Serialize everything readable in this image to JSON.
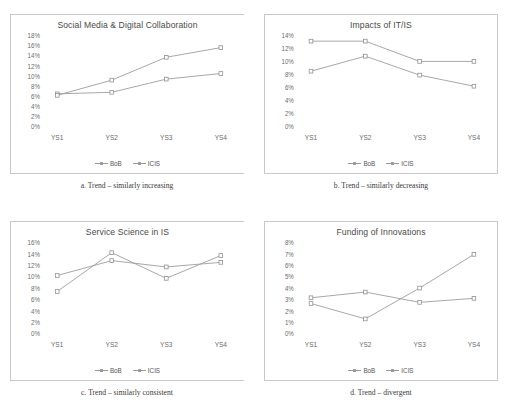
{
  "figure": {
    "series_names": [
      "BoB",
      "ICIS"
    ],
    "x_categories": [
      "YS1",
      "YS2",
      "YS3",
      "YS4"
    ],
    "line_color": "#9a9a9a",
    "panel_border_color": "#c9c9c9"
  },
  "panels": [
    {
      "key": "a",
      "caption_label": "a.",
      "caption_text": "Trend – similarly increasing",
      "caption": "a.  Trend – similarly increasing"
    },
    {
      "key": "b",
      "caption_label": "b.",
      "caption_text": "Trend – similarly decreasing",
      "caption": "b.  Trend – similarly decreasing"
    },
    {
      "key": "c",
      "caption_label": "c.",
      "caption_text": "Trend – similarly consistent",
      "caption": "c.  Trend – similarly consistent"
    },
    {
      "key": "d",
      "caption_label": "d.",
      "caption_text": "Trend – divergent",
      "caption": "d.  Trend – divergent"
    }
  ],
  "chart_data": [
    {
      "type": "line",
      "title": "Social Media & Digital Collaboration",
      "xlabel": "",
      "ylabel": "",
      "categories": [
        "YS1",
        "YS2",
        "YS3",
        "YS4"
      ],
      "ylim": [
        0,
        18
      ],
      "yticks": [
        18,
        16,
        14,
        12,
        10,
        8,
        6,
        4,
        2,
        0
      ],
      "ytick_labels": [
        "18%",
        "16%",
        "14%",
        "12%",
        "10%",
        "8%",
        "6%",
        "4%",
        "2%",
        "0%"
      ],
      "grid": false,
      "legend_position": "bottom",
      "series": [
        {
          "name": "BoB",
          "values": [
            6.6,
            6.9,
            9.5,
            10.6
          ]
        },
        {
          "name": "ICIS",
          "values": [
            6.3,
            9.3,
            13.8,
            15.7
          ]
        }
      ]
    },
    {
      "type": "line",
      "title": "Impacts of IT/IS",
      "xlabel": "",
      "ylabel": "",
      "categories": [
        "YS1",
        "YS2",
        "YS3",
        "YS4"
      ],
      "ylim": [
        0,
        14
      ],
      "yticks": [
        14,
        12,
        10,
        8,
        6,
        4,
        2,
        0
      ],
      "ytick_labels": [
        "14%",
        "12%",
        "10%",
        "8%",
        "6%",
        "4%",
        "2%",
        "0%"
      ],
      "grid": false,
      "legend_position": "bottom",
      "series": [
        {
          "name": "BoB",
          "values": [
            8.6,
            10.9,
            8.0,
            6.3
          ]
        },
        {
          "name": "ICIS",
          "values": [
            13.2,
            13.2,
            10.1,
            10.1
          ]
        }
      ]
    },
    {
      "type": "line",
      "title": "Service Science in IS",
      "xlabel": "",
      "ylabel": "",
      "categories": [
        "YS1",
        "YS2",
        "YS3",
        "YS4"
      ],
      "ylim": [
        0,
        16
      ],
      "yticks": [
        16,
        14,
        12,
        10,
        8,
        6,
        4,
        2,
        0
      ],
      "ytick_labels": [
        "16%",
        "14%",
        "12%",
        "10%",
        "8%",
        "6%",
        "4%",
        "2%",
        "0%"
      ],
      "grid": false,
      "legend_position": "bottom",
      "series": [
        {
          "name": "BoB",
          "values": [
            7.5,
            14.3,
            9.8,
            13.8
          ]
        },
        {
          "name": "ICIS",
          "values": [
            10.3,
            12.9,
            11.8,
            12.6
          ]
        }
      ]
    },
    {
      "type": "line",
      "title": "Funding of Innovations",
      "xlabel": "",
      "ylabel": "",
      "categories": [
        "YS1",
        "YS2",
        "YS3",
        "YS4"
      ],
      "ylim": [
        0,
        8
      ],
      "yticks": [
        8,
        7,
        6,
        5,
        4,
        3,
        2,
        1,
        0
      ],
      "ytick_labels": [
        "8%",
        "7%",
        "6%",
        "5%",
        "4%",
        "3%",
        "2%",
        "1%",
        "0%"
      ],
      "grid": false,
      "legend_position": "bottom",
      "series": [
        {
          "name": "BoB",
          "values": [
            2.7,
            1.35,
            4.05,
            7.0
          ]
        },
        {
          "name": "ICIS",
          "values": [
            3.2,
            3.7,
            2.8,
            3.15
          ]
        }
      ]
    }
  ]
}
